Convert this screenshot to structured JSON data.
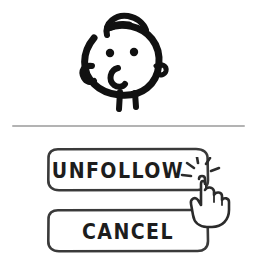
{
  "dialog": {
    "name": "unfollow-confirmation-dialog",
    "background_color": "#ffffff"
  },
  "avatar": {
    "icon_name": "doodle-face-avatar",
    "description": "Hand-drawn round face with hair curl, two dot eyes and small legs",
    "stroke_color": "#111111"
  },
  "divider": {
    "name": "horizontal-divider",
    "color": "#9a9a9a"
  },
  "buttons": [
    {
      "name": "unfollow-button",
      "label": "UNFOLLOW",
      "border_color": "#3a3a3a",
      "text_color": "#1d1d1d",
      "fill_color": "#ffffff",
      "state": "being-clicked"
    },
    {
      "name": "cancel-button",
      "label": "CANCEL",
      "border_color": "#3a3a3a",
      "text_color": "#1d1d1d",
      "fill_color": "#ffffff",
      "state": "default"
    }
  ],
  "cursor": {
    "icon_name": "pointing-hand-cursor",
    "click_effect_icon_name": "click-sparkle-icon",
    "stroke_color": "#2b2b2b",
    "target": "unfollow-button"
  }
}
